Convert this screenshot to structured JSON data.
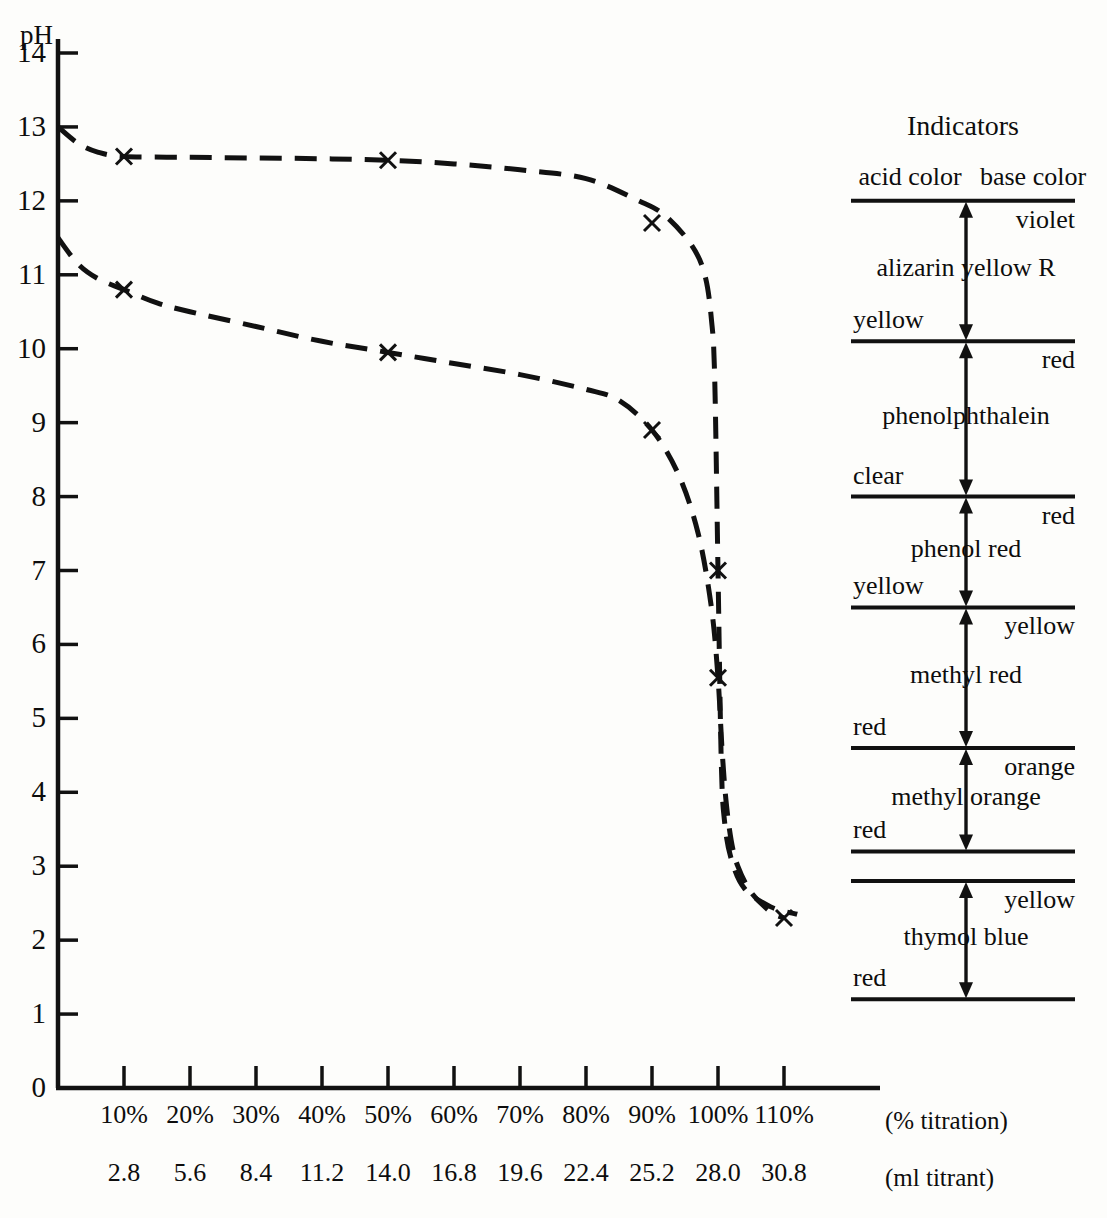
{
  "axes": {
    "y_title": "pH",
    "y_ticks": [
      "14",
      "13",
      "12",
      "11",
      "10",
      "9",
      "8",
      "7",
      "6",
      "5",
      "4",
      "3",
      "2",
      "1",
      "0"
    ],
    "x_ticks_percent": [
      "10%",
      "20%",
      "30%",
      "40%",
      "50%",
      "60%",
      "70%",
      "80%",
      "90%",
      "100%",
      "110%"
    ],
    "x_ticks_ml": [
      "2.8",
      "5.6",
      "8.4",
      "11.2",
      "14.0",
      "16.8",
      "19.6",
      "22.4",
      "25.2",
      "28.0",
      "30.8"
    ],
    "x_caption_percent": "(% titration)",
    "x_caption_ml": "(ml titrant)"
  },
  "indicators_panel": {
    "title": "Indicators",
    "acid_header": "acid color",
    "base_header": "base color",
    "entries": [
      {
        "name": "alizarin yellow R",
        "acid_color": "yellow",
        "base_color": "violet",
        "ph_low": 10.1,
        "ph_high": 12.0
      },
      {
        "name": "phenolphthalein",
        "acid_color": "clear",
        "base_color": "red",
        "ph_low": 8.0,
        "ph_high": 10.1
      },
      {
        "name": "phenol red",
        "acid_color": "yellow",
        "base_color": "red",
        "ph_low": 6.5,
        "ph_high": 8.0
      },
      {
        "name": "methyl red",
        "acid_color": "red",
        "base_color": "yellow",
        "ph_low": 4.6,
        "ph_high": 6.5
      },
      {
        "name": "methyl orange",
        "acid_color": "red",
        "base_color": "orange",
        "ph_low": 3.2,
        "ph_high": 4.6
      },
      {
        "name": "thymol blue",
        "acid_color": "red",
        "base_color": "yellow",
        "ph_low": 1.2,
        "ph_high": 2.8
      }
    ]
  },
  "chart_data": {
    "type": "line",
    "title": "",
    "xlabel": "(% titration)",
    "ylabel": "pH",
    "xlim": [
      0,
      115
    ],
    "ylim": [
      0,
      14
    ],
    "grid": false,
    "legend": "none",
    "x_secondary_label": "(ml titrant)",
    "x_secondary_values": [
      2.8,
      5.6,
      8.4,
      11.2,
      14.0,
      16.8,
      19.6,
      22.4,
      25.2,
      28.0,
      30.8
    ],
    "series": [
      {
        "name": "strong base titrated with strong acid",
        "style": "dashed",
        "marker": "x",
        "x": [
          0,
          3,
          6,
          10,
          20,
          30,
          40,
          50,
          60,
          70,
          80,
          88,
          92,
          96,
          98,
          99,
          99.5,
          100,
          100.5,
          101,
          102,
          104,
          108,
          112
        ],
        "y": [
          13.0,
          12.78,
          12.66,
          12.6,
          12.59,
          12.58,
          12.57,
          12.55,
          12.5,
          12.42,
          12.3,
          12.0,
          11.8,
          11.4,
          11.0,
          10.4,
          9.6,
          7.0,
          4.4,
          3.6,
          3.1,
          2.7,
          2.45,
          2.35
        ],
        "markers": [
          {
            "x": 10,
            "y": 12.6
          },
          {
            "x": 50,
            "y": 12.55
          },
          {
            "x": 90,
            "y": 11.7
          }
        ]
      },
      {
        "name": "weak base titrated with strong acid",
        "style": "dashed",
        "marker": "x",
        "x": [
          0,
          3,
          6,
          10,
          15,
          20,
          30,
          40,
          50,
          60,
          70,
          80,
          85,
          90,
          94,
          97,
          99,
          100,
          100.6,
          101.2,
          102,
          103,
          105,
          108,
          110
        ],
        "y": [
          11.5,
          11.15,
          10.95,
          10.8,
          10.62,
          10.5,
          10.3,
          10.1,
          9.95,
          9.8,
          9.65,
          9.45,
          9.3,
          8.9,
          8.3,
          7.5,
          6.5,
          5.55,
          4.6,
          3.9,
          3.35,
          3.0,
          2.65,
          2.38,
          2.3
        ],
        "markers": [
          {
            "x": 10,
            "y": 10.8
          },
          {
            "x": 50,
            "y": 9.95
          },
          {
            "x": 90,
            "y": 8.9
          },
          {
            "x": 100,
            "y": 5.55
          },
          {
            "x": 110,
            "y": 2.3
          }
        ]
      }
    ],
    "equivalence_point_ph": 7.0,
    "shared_markers": [
      {
        "x": 100,
        "y": 7.0,
        "series": "strong base titrated with strong acid"
      }
    ]
  }
}
